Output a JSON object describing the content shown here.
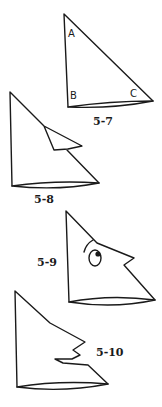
{
  "figures": [
    {
      "id": "5-7",
      "label": "5-7",
      "corners": [
        "A",
        "B",
        "C"
      ]
    },
    {
      "id": "5-8",
      "label": "5-8"
    },
    {
      "id": "5-9",
      "label": "5-9"
    },
    {
      "id": "5-10",
      "label": "5-10"
    }
  ],
  "colors": {
    "ink": "#1a1a1a",
    "paper": "#ffffff"
  }
}
